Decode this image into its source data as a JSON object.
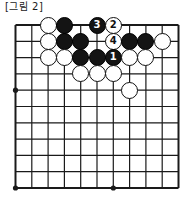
{
  "figure": {
    "caption": "[그림 2]",
    "kind": "go-board-diagram",
    "board": {
      "columns": 11,
      "rows": 11,
      "line_color": "#1a1a1a",
      "background_color": "#ffffff",
      "edges_shown": [
        "top",
        "left",
        "right",
        "bottom"
      ],
      "star_points": [
        {
          "col": 0,
          "row": 4
        },
        {
          "col": 0,
          "row": 10
        },
        {
          "col": 6,
          "row": 10
        }
      ]
    },
    "stones": [
      {
        "col": 2,
        "row": 0,
        "color": "white",
        "label": ""
      },
      {
        "col": 3,
        "row": 0,
        "color": "black",
        "label": ""
      },
      {
        "col": 5,
        "row": 0,
        "color": "black",
        "label": "3"
      },
      {
        "col": 6,
        "row": 0,
        "color": "white",
        "label": "2"
      },
      {
        "col": 2,
        "row": 1,
        "color": "white",
        "label": ""
      },
      {
        "col": 3,
        "row": 1,
        "color": "black",
        "label": ""
      },
      {
        "col": 4,
        "row": 1,
        "color": "black",
        "label": ""
      },
      {
        "col": 6,
        "row": 1,
        "color": "white",
        "label": "4"
      },
      {
        "col": 7,
        "row": 1,
        "color": "black",
        "label": ""
      },
      {
        "col": 8,
        "row": 1,
        "color": "black",
        "label": ""
      },
      {
        "col": 9,
        "row": 1,
        "color": "white",
        "label": ""
      },
      {
        "col": 2,
        "row": 2,
        "color": "white",
        "label": ""
      },
      {
        "col": 3,
        "row": 2,
        "color": "white",
        "label": ""
      },
      {
        "col": 4,
        "row": 2,
        "color": "black",
        "label": ""
      },
      {
        "col": 5,
        "row": 2,
        "color": "black",
        "label": ""
      },
      {
        "col": 6,
        "row": 2,
        "color": "black",
        "label": "1"
      },
      {
        "col": 7,
        "row": 2,
        "color": "white",
        "label": ""
      },
      {
        "col": 8,
        "row": 2,
        "color": "white",
        "label": ""
      },
      {
        "col": 4,
        "row": 3,
        "color": "white",
        "label": ""
      },
      {
        "col": 5,
        "row": 3,
        "color": "white",
        "label": ""
      },
      {
        "col": 6,
        "row": 3,
        "color": "white",
        "label": ""
      },
      {
        "col": 7,
        "row": 4,
        "color": "white",
        "label": ""
      }
    ],
    "move_sequence": [
      {
        "number": "1",
        "color": "black"
      },
      {
        "number": "2",
        "color": "white"
      },
      {
        "number": "3",
        "color": "black"
      },
      {
        "number": "4",
        "color": "white"
      }
    ]
  }
}
